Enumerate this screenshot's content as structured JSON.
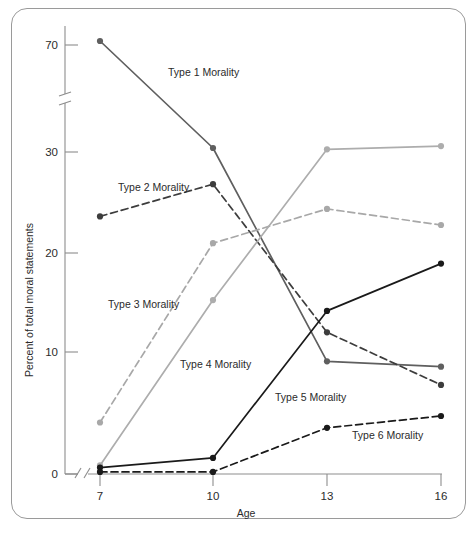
{
  "figure": {
    "title": "",
    "frame": true
  },
  "chart_data": {
    "type": "line",
    "title": "",
    "xlabel": "Age",
    "ylabel": "Percent of total moral statements",
    "x": [
      7,
      10,
      13,
      16
    ],
    "xtick_labels": [
      "7",
      "10",
      "13",
      "16"
    ],
    "ytick_labels": [
      "0",
      "10",
      "20",
      "30",
      "70"
    ],
    "yticks": [
      0,
      10,
      20,
      30,
      70
    ],
    "ylim": [
      0,
      75
    ],
    "xlim": [
      7,
      16
    ],
    "axis_break_y": true,
    "axis_break_x": true,
    "grid": false,
    "legend": "inline-labels",
    "series": [
      {
        "name": "Type 1 Morality",
        "label": "Type 1 Morality",
        "color": "#5f5f5f",
        "dash": "solid",
        "values": [
          71.5,
          31.5,
          10.5,
          10.0
        ]
      },
      {
        "name": "Type 2 Morality",
        "label": "Type 2 Morality",
        "color": "#3d3d3d",
        "dash": "dashed",
        "values": [
          24.0,
          27.0,
          13.2,
          8.3
        ]
      },
      {
        "name": "Type 3 Morality",
        "label": "Type 3 Morality",
        "color": "#a8a8a8",
        "dash": "dashed",
        "values": [
          4.8,
          21.5,
          24.7,
          23.2
        ]
      },
      {
        "name": "Type 4 Morality",
        "label": "Type 4 Morality",
        "color": "#adadad",
        "dash": "solid",
        "values": [
          0.8,
          16.2,
          31.0,
          32.2
        ]
      },
      {
        "name": "Type 5 Morality",
        "label": "Type 5 Morality",
        "color": "#1a1a1a",
        "dash": "solid",
        "values": [
          0.6,
          1.5,
          15.2,
          19.6
        ]
      },
      {
        "name": "Type 6 Morality",
        "label": "Type 6 Morality",
        "color": "#1a1a1a",
        "dash": "dashed",
        "values": [
          0.2,
          0.2,
          4.3,
          5.4
        ]
      }
    ],
    "series_label_positions": [
      {
        "name": "Type 1 Morality",
        "x": 168,
        "y": 76
      },
      {
        "name": "Type 2 Morality",
        "x": 118,
        "y": 191
      },
      {
        "name": "Type 3 Morality",
        "x": 108,
        "y": 308
      },
      {
        "name": "Type 4 Morality",
        "x": 180,
        "y": 368
      },
      {
        "name": "Type 5 Morality",
        "x": 275,
        "y": 401
      },
      {
        "name": "Type 6 Morality",
        "x": 352,
        "y": 439
      }
    ]
  }
}
